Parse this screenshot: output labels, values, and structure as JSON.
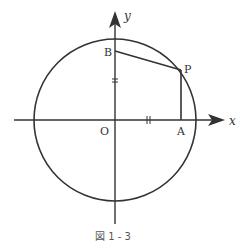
{
  "figure": {
    "caption": "図 1 - 3",
    "axes": {
      "x_label": "x",
      "y_label": "y"
    },
    "points": {
      "origin": "O",
      "A": "A",
      "B": "B",
      "P": "P"
    },
    "tick_marks": {
      "on_y_axis": "=",
      "on_x_axis": "||"
    },
    "colors": {
      "stroke": "#333333",
      "text": "#333333"
    }
  }
}
